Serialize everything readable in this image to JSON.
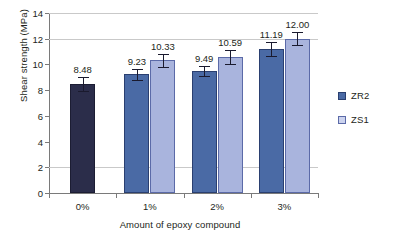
{
  "chart_data": {
    "type": "bar",
    "title": "",
    "xlabel": "Amount of epoxy compound",
    "ylabel": "Shear strength (MPa)",
    "categories": [
      "0%",
      "1%",
      "2%",
      "3%"
    ],
    "ylim": [
      0,
      14
    ],
    "yticks": [
      0,
      2,
      4,
      6,
      8,
      10,
      12,
      14
    ],
    "ytick_labels": [
      "0",
      "2",
      "4",
      "6",
      "8",
      "10",
      "12",
      "14"
    ],
    "gridlines": [
      2,
      12,
      14
    ],
    "grid": true,
    "legend_position": "right",
    "series": [
      {
        "name": "ZR2",
        "color": "#4a6aa5",
        "values": [
          8.48,
          9.23,
          9.49,
          11.19
        ],
        "labels": [
          "8.48",
          "9.23",
          "9.49",
          "11.19"
        ],
        "errors": [
          0.52,
          0.45,
          0.4,
          0.55
        ]
      },
      {
        "name": "ZS1",
        "color": "#a9b4dd",
        "values": [
          null,
          10.33,
          10.59,
          12.0
        ],
        "labels": [
          "",
          "10.33",
          "10.59",
          "12.00"
        ],
        "errors": [
          null,
          0.5,
          0.55,
          0.52
        ]
      }
    ]
  },
  "legend": {
    "items": [
      {
        "label": "ZR2",
        "color": "#4a6aa5"
      },
      {
        "label": "ZS1",
        "color": "#ccd3ee"
      }
    ]
  },
  "colors": {
    "zr2": "#4a6aa5",
    "zs1": "#a9b4dd",
    "zero_bar": "#2b2d4a",
    "axis": "#7a7a7a",
    "grid": "#c9c9c9",
    "text": "#231f20"
  }
}
